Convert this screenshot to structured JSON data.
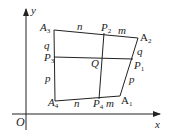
{
  "axes": {
    "x_label": "x",
    "y_label": "y",
    "origin_label": "O"
  },
  "vertices": {
    "A1": {
      "name": "A",
      "sub": "1"
    },
    "A2": {
      "name": "A",
      "sub": "2"
    },
    "A3": {
      "name": "A",
      "sub": "3"
    },
    "A4": {
      "name": "A",
      "sub": "4"
    }
  },
  "midpoints": {
    "P1": {
      "name": "P",
      "sub": "1"
    },
    "P2": {
      "name": "P",
      "sub": "2"
    },
    "P3": {
      "name": "P",
      "sub": "3"
    },
    "P4": {
      "name": "P",
      "sub": "4"
    }
  },
  "center": {
    "label": "Q"
  },
  "segment_labels": {
    "top_left": "n",
    "top_right": "m",
    "bottom_left": "n",
    "bottom_right": "m",
    "left_upper": "q",
    "left_lower": "p",
    "right_upper": "q",
    "right_lower": "p"
  },
  "colors": {
    "line": "#222222"
  }
}
